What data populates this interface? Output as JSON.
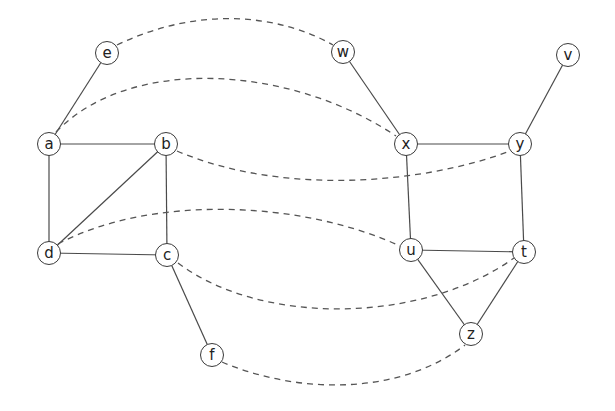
{
  "graph": {
    "node_radius": 12,
    "nodes": [
      {
        "id": "e",
        "label": "e",
        "x": 107,
        "y": 53
      },
      {
        "id": "a",
        "label": "a",
        "x": 49,
        "y": 144
      },
      {
        "id": "b",
        "label": "b",
        "x": 166,
        "y": 144
      },
      {
        "id": "d",
        "label": "d",
        "x": 49,
        "y": 253
      },
      {
        "id": "c",
        "label": "c",
        "x": 167,
        "y": 255
      },
      {
        "id": "f",
        "label": "f",
        "x": 212,
        "y": 355
      },
      {
        "id": "w",
        "label": "w",
        "x": 343,
        "y": 52
      },
      {
        "id": "v",
        "label": "v",
        "x": 568,
        "y": 55
      },
      {
        "id": "x",
        "label": "x",
        "x": 406,
        "y": 144
      },
      {
        "id": "y",
        "label": "y",
        "x": 520,
        "y": 144
      },
      {
        "id": "u",
        "label": "u",
        "x": 411,
        "y": 250
      },
      {
        "id": "t",
        "label": "t",
        "x": 524,
        "y": 252
      },
      {
        "id": "z",
        "label": "z",
        "x": 471,
        "y": 334
      }
    ],
    "solid_edges": [
      [
        "e",
        "a"
      ],
      [
        "a",
        "b"
      ],
      [
        "a",
        "d"
      ],
      [
        "b",
        "d"
      ],
      [
        "b",
        "c"
      ],
      [
        "d",
        "c"
      ],
      [
        "c",
        "f"
      ],
      [
        "w",
        "x"
      ],
      [
        "x",
        "y"
      ],
      [
        "v",
        "y"
      ],
      [
        "x",
        "u"
      ],
      [
        "y",
        "t"
      ],
      [
        "u",
        "t"
      ],
      [
        "u",
        "z"
      ],
      [
        "t",
        "z"
      ]
    ],
    "dashed_edges": [
      {
        "from": "e",
        "to": "w",
        "path": "M117,45 C200,5 280,15 333,45"
      },
      {
        "from": "a",
        "to": "x",
        "path": "M56,132 C130,55 290,65 396,136"
      },
      {
        "from": "b",
        "to": "y",
        "path": "M177,151 C280,195 420,185 510,151"
      },
      {
        "from": "d",
        "to": "u",
        "path": "M58,244 C150,195 300,200 400,246"
      },
      {
        "from": "c",
        "to": "t",
        "path": "M178,263 C260,325 420,325 514,258"
      },
      {
        "from": "f",
        "to": "z",
        "path": "M222,362 C300,395 400,395 465,345"
      }
    ],
    "colors": {
      "stroke": "#4a4a4a",
      "background": "#ffffff",
      "text": "#222222"
    }
  }
}
